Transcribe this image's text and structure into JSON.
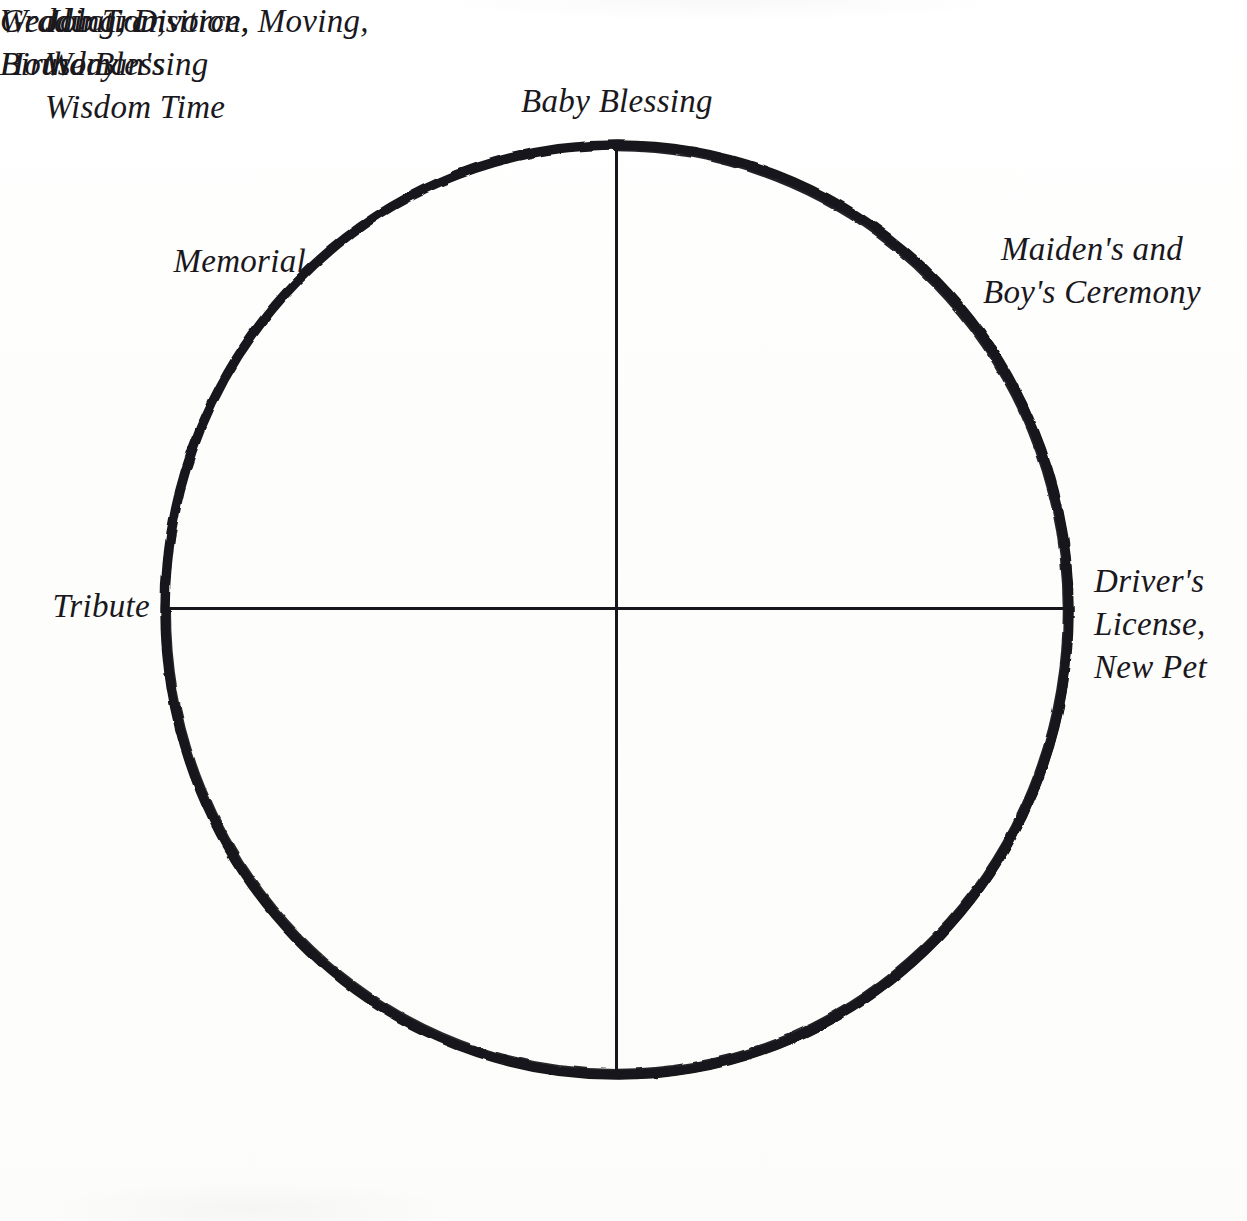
{
  "page": {
    "background_color": "#fdfdfc",
    "ink_color": "#17161a",
    "page_number": ". 255"
  },
  "diagram": {
    "type": "circle-with-cross-axes",
    "circle": {
      "center_x": 617,
      "center_y": 610,
      "radius_x": 452,
      "radius_y": 465,
      "stroke_width": 9,
      "stroke_color": "#17161a"
    },
    "axes": {
      "vertical_stroke_width": 8,
      "horizontal_stroke_width": 8,
      "stroke_color": "#17161a"
    },
    "labels": [
      {
        "position": "top",
        "text": "Baby Blessing"
      },
      {
        "position": "upper-left",
        "text": "Memorial"
      },
      {
        "position": "upper-right",
        "text": "Maiden's and\nBoy's Ceremony"
      },
      {
        "position": "left",
        "text": "Tribute"
      },
      {
        "position": "right",
        "text": "Driver's\nLicense,\nNew Pet"
      },
      {
        "position": "lower-left",
        "text": "Job Transition,\nWoman's\nWisdom Time"
      },
      {
        "position": "lower-right",
        "text": "Graduation,\nBirthday"
      },
      {
        "position": "bottom",
        "text": "Wedding, Divorce, Moving,\nHouse Blessing"
      }
    ]
  }
}
